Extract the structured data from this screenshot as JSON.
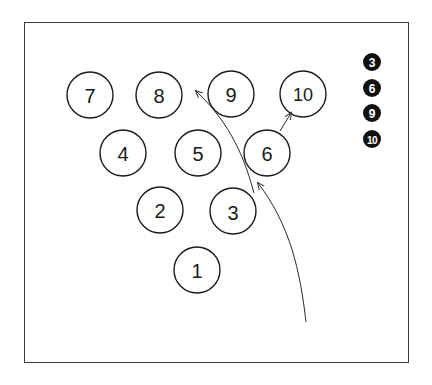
{
  "diagram": {
    "type": "bowling-pin-layout",
    "pins": [
      {
        "label": "1",
        "cx": 197,
        "cy": 270
      },
      {
        "label": "2",
        "cx": 160,
        "cy": 210
      },
      {
        "label": "3",
        "cx": 233,
        "cy": 211
      },
      {
        "label": "4",
        "cx": 123,
        "cy": 153
      },
      {
        "label": "5",
        "cx": 198,
        "cy": 153
      },
      {
        "label": "6",
        "cx": 267,
        "cy": 153
      },
      {
        "label": "7",
        "cx": 90,
        "cy": 95
      },
      {
        "label": "8",
        "cx": 159,
        "cy": 95
      },
      {
        "label": "9",
        "cx": 231,
        "cy": 94
      },
      {
        "label": "10",
        "cx": 303,
        "cy": 94
      }
    ],
    "pin_radius": 23,
    "remaining_pins_legend": [
      "3",
      "6",
      "9",
      "10"
    ],
    "arrows": [
      {
        "name": "ball-path",
        "from": "bottom-right",
        "to": "pin-3/6 gap"
      },
      {
        "name": "pin-3-deflection",
        "from": "pin-3",
        "to": "pin-8"
      },
      {
        "name": "pin-6-deflection",
        "from": "pin-6",
        "to": "pin-10"
      }
    ],
    "colors": {
      "stroke": "#1a1a1a",
      "badge_fill": "#111111",
      "badge_text": "#ffffff",
      "background": "#ffffff"
    }
  }
}
